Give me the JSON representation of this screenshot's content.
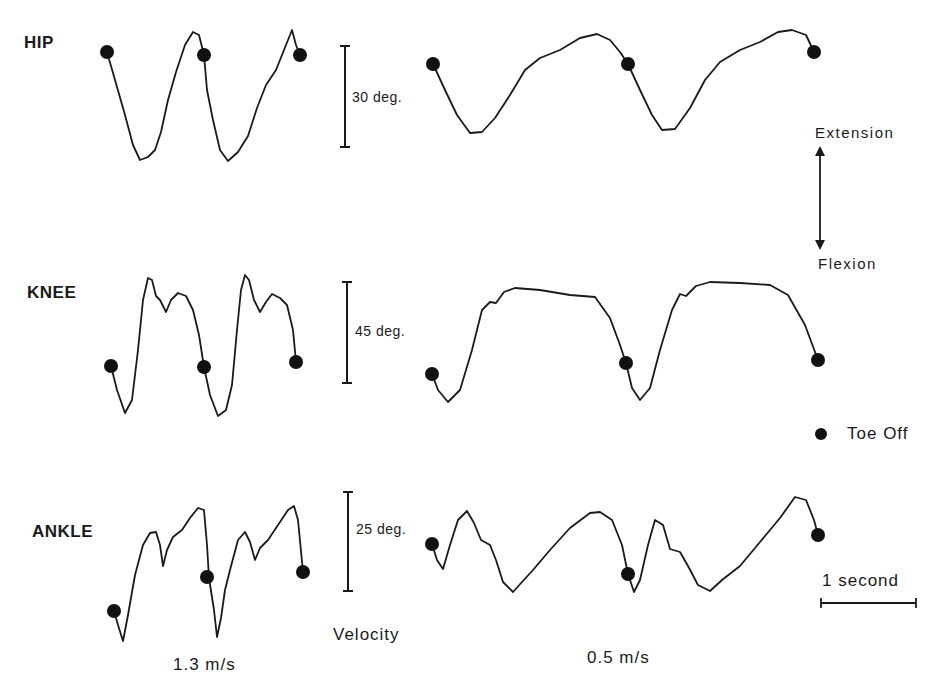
{
  "figure": {
    "joints": [
      "HIP",
      "KNEE",
      "ANKLE"
    ],
    "scale_bars": [
      "30 deg.",
      "45 deg.",
      "25 deg."
    ],
    "velocity_label": "Velocity",
    "velocities": [
      "1.3 m/s",
      "0.5 m/s"
    ],
    "direction": {
      "up": "Extension",
      "down": "Flexion"
    },
    "legend": {
      "marker": "●",
      "label": "Toe Off"
    },
    "time_scale": "1 second"
  },
  "chart_data": {
    "type": "line",
    "title": "",
    "xlabel": "Time (1 second scale bar)",
    "ylabel": "Joint angle (Extension up / Flexion down)",
    "grid": false,
    "legend_position": "right",
    "legend": [
      {
        "marker": "filled circle",
        "label": "Toe Off"
      }
    ],
    "panels": [
      {
        "joint": "HIP",
        "scale_deg": 30,
        "velocity": "1.3 m/s",
        "color": "#1a1a1a",
        "points": [
          [
            107,
            52
          ],
          [
            115,
            80
          ],
          [
            125,
            115
          ],
          [
            133,
            145
          ],
          [
            140,
            160
          ],
          [
            148,
            157
          ],
          [
            155,
            150
          ],
          [
            161,
            132
          ],
          [
            168,
            100
          ],
          [
            176,
            72
          ],
          [
            185,
            45
          ],
          [
            193,
            32
          ],
          [
            199,
            35
          ],
          [
            204,
            55
          ],
          [
            207,
            90
          ],
          [
            213,
            120
          ],
          [
            220,
            150
          ],
          [
            228,
            161
          ],
          [
            238,
            152
          ],
          [
            248,
            136
          ],
          [
            257,
            108
          ],
          [
            266,
            85
          ],
          [
            276,
            70
          ],
          [
            284,
            50
          ],
          [
            292,
            30
          ],
          [
            296,
            45
          ],
          [
            300,
            55
          ]
        ],
        "toe_off": [
          [
            107,
            52
          ],
          [
            204,
            55
          ],
          [
            300,
            55
          ]
        ]
      },
      {
        "joint": "HIP",
        "scale_deg": 30,
        "velocity": "0.5 m/s",
        "color": "#1a1a1a",
        "points": [
          [
            433,
            64
          ],
          [
            445,
            90
          ],
          [
            457,
            115
          ],
          [
            470,
            133
          ],
          [
            482,
            132
          ],
          [
            495,
            118
          ],
          [
            510,
            95
          ],
          [
            525,
            70
          ],
          [
            540,
            58
          ],
          [
            560,
            50
          ],
          [
            580,
            38
          ],
          [
            597,
            34
          ],
          [
            610,
            40
          ],
          [
            620,
            52
          ],
          [
            628,
            64
          ],
          [
            640,
            90
          ],
          [
            652,
            115
          ],
          [
            662,
            130
          ],
          [
            675,
            129
          ],
          [
            690,
            108
          ],
          [
            705,
            80
          ],
          [
            720,
            62
          ],
          [
            740,
            50
          ],
          [
            760,
            42
          ],
          [
            778,
            32
          ],
          [
            792,
            30
          ],
          [
            806,
            35
          ],
          [
            814,
            52
          ]
        ],
        "toe_off": [
          [
            433,
            64
          ],
          [
            628,
            64
          ],
          [
            814,
            52
          ]
        ]
      },
      {
        "joint": "KNEE",
        "scale_deg": 45,
        "velocity": "1.3 m/s",
        "color": "#1a1a1a",
        "points": [
          [
            111,
            366
          ],
          [
            117,
            390
          ],
          [
            125,
            413
          ],
          [
            132,
            400
          ],
          [
            138,
            350
          ],
          [
            143,
            300
          ],
          [
            148,
            278
          ],
          [
            152,
            280
          ],
          [
            156,
            296
          ],
          [
            160,
            300
          ],
          [
            166,
            312
          ],
          [
            171,
            300
          ],
          [
            178,
            293
          ],
          [
            186,
            296
          ],
          [
            193,
            310
          ],
          [
            199,
            335
          ],
          [
            204,
            367
          ],
          [
            210,
            395
          ],
          [
            218,
            416
          ],
          [
            226,
            410
          ],
          [
            232,
            385
          ],
          [
            237,
            330
          ],
          [
            241,
            290
          ],
          [
            245,
            275
          ],
          [
            249,
            280
          ],
          [
            254,
            300
          ],
          [
            260,
            312
          ],
          [
            266,
            302
          ],
          [
            272,
            294
          ],
          [
            280,
            298
          ],
          [
            287,
            305
          ],
          [
            293,
            330
          ],
          [
            296,
            362
          ]
        ],
        "toe_off": [
          [
            111,
            366
          ],
          [
            204,
            367
          ],
          [
            296,
            362
          ]
        ]
      },
      {
        "joint": "KNEE",
        "scale_deg": 45,
        "velocity": "0.5 m/s",
        "color": "#1a1a1a",
        "points": [
          [
            432,
            374
          ],
          [
            438,
            390
          ],
          [
            448,
            402
          ],
          [
            460,
            390
          ],
          [
            472,
            350
          ],
          [
            482,
            310
          ],
          [
            490,
            302
          ],
          [
            496,
            303
          ],
          [
            504,
            292
          ],
          [
            515,
            288
          ],
          [
            540,
            290
          ],
          [
            570,
            295
          ],
          [
            595,
            297
          ],
          [
            610,
            318
          ],
          [
            620,
            345
          ],
          [
            626,
            363
          ],
          [
            632,
            388
          ],
          [
            640,
            400
          ],
          [
            650,
            388
          ],
          [
            660,
            350
          ],
          [
            672,
            310
          ],
          [
            680,
            294
          ],
          [
            686,
            296
          ],
          [
            696,
            286
          ],
          [
            710,
            282
          ],
          [
            740,
            283
          ],
          [
            770,
            285
          ],
          [
            788,
            295
          ],
          [
            805,
            325
          ],
          [
            818,
            360
          ]
        ],
        "toe_off": [
          [
            432,
            374
          ],
          [
            626,
            363
          ],
          [
            818,
            360
          ]
        ]
      },
      {
        "joint": "ANKLE",
        "scale_deg": 25,
        "velocity": "1.3 m/s",
        "color": "#1a1a1a",
        "points": [
          [
            114,
            611
          ],
          [
            118,
            625
          ],
          [
            123,
            641
          ],
          [
            128,
            615
          ],
          [
            135,
            575
          ],
          [
            143,
            545
          ],
          [
            150,
            533
          ],
          [
            156,
            532
          ],
          [
            160,
            545
          ],
          [
            163,
            566
          ],
          [
            167,
            550
          ],
          [
            173,
            537
          ],
          [
            182,
            530
          ],
          [
            190,
            518
          ],
          [
            198,
            508
          ],
          [
            204,
            510
          ],
          [
            207,
            545
          ],
          [
            209,
            578
          ],
          [
            214,
            610
          ],
          [
            217,
            637
          ],
          [
            221,
            618
          ],
          [
            225,
            590
          ],
          [
            230,
            570
          ],
          [
            238,
            540
          ],
          [
            245,
            532
          ],
          [
            250,
            542
          ],
          [
            255,
            560
          ],
          [
            260,
            548
          ],
          [
            268,
            540
          ],
          [
            278,
            525
          ],
          [
            288,
            510
          ],
          [
            294,
            506
          ],
          [
            298,
            520
          ],
          [
            303,
            572
          ]
        ],
        "toe_off": [
          [
            114,
            611
          ],
          [
            207,
            577
          ],
          [
            303,
            572
          ]
        ]
      },
      {
        "joint": "ANKLE",
        "scale_deg": 25,
        "velocity": "0.5 m/s",
        "color": "#1a1a1a",
        "points": [
          [
            432,
            544
          ],
          [
            437,
            560
          ],
          [
            443,
            569
          ],
          [
            450,
            545
          ],
          [
            458,
            520
          ],
          [
            467,
            511
          ],
          [
            474,
            523
          ],
          [
            481,
            540
          ],
          [
            490,
            545
          ],
          [
            496,
            560
          ],
          [
            503,
            582
          ],
          [
            513,
            592
          ],
          [
            522,
            582
          ],
          [
            533,
            570
          ],
          [
            550,
            550
          ],
          [
            570,
            528
          ],
          [
            590,
            513
          ],
          [
            600,
            512
          ],
          [
            612,
            520
          ],
          [
            622,
            545
          ],
          [
            628,
            574
          ],
          [
            634,
            592
          ],
          [
            640,
            580
          ],
          [
            648,
            545
          ],
          [
            655,
            520
          ],
          [
            663,
            525
          ],
          [
            670,
            549
          ],
          [
            680,
            552
          ],
          [
            688,
            566
          ],
          [
            698,
            585
          ],
          [
            710,
            591
          ],
          [
            722,
            580
          ],
          [
            740,
            566
          ],
          [
            760,
            542
          ],
          [
            780,
            518
          ],
          [
            795,
            497
          ],
          [
            806,
            500
          ],
          [
            814,
            520
          ],
          [
            818,
            535
          ]
        ],
        "toe_off": [
          [
            432,
            544
          ],
          [
            628,
            574
          ],
          [
            818,
            535
          ]
        ]
      }
    ]
  }
}
